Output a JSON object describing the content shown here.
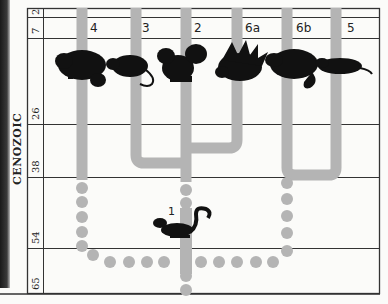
{
  "diagram": {
    "type": "phylogenetic-tree",
    "era_label": "CENOZOIC",
    "time_scale_mya": [
      "2",
      "7",
      "26",
      "38",
      "54",
      "65"
    ],
    "lineages": [
      {
        "id": "4",
        "label": "4",
        "animal": "hamster-like rodent"
      },
      {
        "id": "3",
        "label": "3",
        "animal": "rat"
      },
      {
        "id": "2",
        "label": "2",
        "animal": "squirrel"
      },
      {
        "id": "6a",
        "label": "6a",
        "animal": "porcupine"
      },
      {
        "id": "6b",
        "label": "6b",
        "animal": "beaver"
      },
      {
        "id": "5",
        "label": "5",
        "animal": "long-bodied rodent"
      }
    ],
    "ancestor": {
      "label": "1",
      "animal": "ancestral squirrel-like rodent"
    },
    "colors": {
      "branch": "#b4b4b4",
      "grid": "#333333",
      "silhouette": "#111111",
      "background": "#fbfbf9"
    }
  }
}
